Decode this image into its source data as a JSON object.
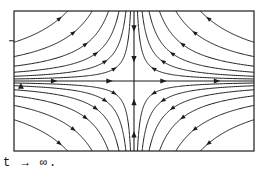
{
  "page": {
    "background": "#ffffff",
    "ink_color": "#1c1c1c"
  },
  "caption": {
    "text": "t → ∞.",
    "font": "monospace-serif"
  },
  "figure": {
    "name": "phase-portrait-saddle",
    "frame": {
      "x": 14,
      "y": 11,
      "width": 240,
      "height": 140,
      "stroke": "#1c1c1c"
    },
    "origin": {
      "x": 133,
      "y": 87
    },
    "left_marker_label": "y"
  },
  "chart_data": {
    "type": "line",
    "title": "",
    "subtitle": "",
    "xlabel": "",
    "ylabel": "",
    "grid": false,
    "legend": null,
    "plot_kind": "phase-portrait",
    "critical_point": {
      "kind": "saddle",
      "x": 0,
      "y": 0
    },
    "xlim": [
      -2.6,
      2.6
    ],
    "ylim": [
      -1.6,
      1.6
    ],
    "axes": [
      {
        "name": "horizontal-axis",
        "from": [
          -2.6,
          0
        ],
        "to": [
          2.6,
          0
        ],
        "arrow_direction": "right",
        "arrow_positions_x": [
          -1.75,
          -0.55,
          0.62,
          1.78
        ]
      },
      {
        "name": "vertical-axis",
        "from": [
          0,
          -1.6
        ],
        "to": [
          0,
          1.6
        ],
        "arrow_direction": "toward-origin",
        "arrow_positions_y": [
          1.22,
          0.52,
          -0.5,
          -1.24
        ]
      }
    ],
    "series": [
      {
        "name": "hyperbola-k-0.12-Q1",
        "quadrant": 1,
        "k": 0.12,
        "arrow_t": 0.55
      },
      {
        "name": "hyperbola-k-0.28-Q1",
        "quadrant": 1,
        "k": 0.28,
        "arrow_t": 0.55
      },
      {
        "name": "hyperbola-k-0.52-Q1",
        "quadrant": 1,
        "k": 0.52,
        "arrow_t": 0.55
      },
      {
        "name": "hyperbola-k-0.88-Q1",
        "quadrant": 1,
        "k": 0.88,
        "arrow_t": 0.55
      },
      {
        "name": "hyperbola-k-1.45-Q1",
        "quadrant": 1,
        "k": 1.45,
        "arrow_t": 0.55
      },
      {
        "name": "hyperbola-k-2.30-Q1",
        "quadrant": 1,
        "k": 2.3,
        "arrow_t": 0.55
      },
      {
        "name": "hyperbola-k-0.12-Q2",
        "quadrant": 2,
        "k": 0.12,
        "arrow_t": 0.55
      },
      {
        "name": "hyperbola-k-0.28-Q2",
        "quadrant": 2,
        "k": 0.28,
        "arrow_t": 0.55
      },
      {
        "name": "hyperbola-k-0.52-Q2",
        "quadrant": 2,
        "k": 0.52,
        "arrow_t": 0.55
      },
      {
        "name": "hyperbola-k-0.88-Q2",
        "quadrant": 2,
        "k": 0.88,
        "arrow_t": 0.55
      },
      {
        "name": "hyperbola-k-1.45-Q2",
        "quadrant": 2,
        "k": 1.45,
        "arrow_t": 0.55
      },
      {
        "name": "hyperbola-k-2.30-Q2",
        "quadrant": 2,
        "k": 2.3,
        "arrow_t": 0.55
      },
      {
        "name": "hyperbola-k-0.12-Q3",
        "quadrant": 3,
        "k": 0.12,
        "arrow_t": 0.55
      },
      {
        "name": "hyperbola-k-0.28-Q3",
        "quadrant": 3,
        "k": 0.28,
        "arrow_t": 0.55
      },
      {
        "name": "hyperbola-k-0.52-Q3",
        "quadrant": 3,
        "k": 0.52,
        "arrow_t": 0.55
      },
      {
        "name": "hyperbola-k-0.88-Q3",
        "quadrant": 3,
        "k": 0.88,
        "arrow_t": 0.55
      },
      {
        "name": "hyperbola-k-1.45-Q3",
        "quadrant": 3,
        "k": 1.45,
        "arrow_t": 0.55
      },
      {
        "name": "hyperbola-k-2.30-Q3",
        "quadrant": 3,
        "k": 2.3,
        "arrow_t": 0.55
      },
      {
        "name": "hyperbola-k-0.12-Q4",
        "quadrant": 4,
        "k": 0.12,
        "arrow_t": 0.55
      },
      {
        "name": "hyperbola-k-0.28-Q4",
        "quadrant": 4,
        "k": 0.28,
        "arrow_t": 0.55
      },
      {
        "name": "hyperbola-k-0.52-Q4",
        "quadrant": 4,
        "k": 0.52,
        "arrow_t": 0.55
      },
      {
        "name": "hyperbola-k-0.88-Q4",
        "quadrant": 4,
        "k": 0.88,
        "arrow_t": 0.55
      },
      {
        "name": "hyperbola-k-1.45-Q4",
        "quadrant": 4,
        "k": 1.45,
        "arrow_t": 0.55
      },
      {
        "name": "hyperbola-k-2.30-Q4",
        "quadrant": 4,
        "k": 2.3,
        "arrow_t": 0.55
      }
    ],
    "annotations": [
      {
        "name": "left-edge-tick",
        "x": -2.62,
        "y": 0.92,
        "kind": "tick"
      },
      {
        "name": "left-axis-marker",
        "x": -2.45,
        "y": -0.12,
        "kind": "marker",
        "label": "y"
      }
    ]
  }
}
